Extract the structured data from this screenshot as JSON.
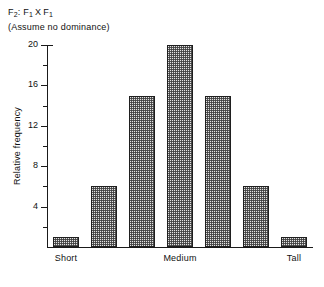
{
  "chart_data": {
    "type": "bar",
    "subtitle": "(Assume no dominance)",
    "title_parts": {
      "f_major": "F",
      "f_major_sub": "2",
      "colon": ":",
      "parent_a": "F",
      "parent_a_sub": "1",
      "cross": "X",
      "parent_b": "F",
      "parent_b_sub": "1"
    },
    "categories": [
      "Short",
      "",
      "",
      "Medium",
      "",
      "",
      "Tall"
    ],
    "category_labels": [
      "Short",
      "Medium",
      "Tall"
    ],
    "values": [
      1,
      6,
      15,
      20,
      15,
      6,
      1
    ],
    "xlabel": "",
    "ylabel": "Relative frequency",
    "ylim": [
      0,
      20
    ],
    "ytick_labels": [
      "4",
      "8",
      "12",
      "16",
      "20"
    ],
    "ytick_values": [
      4,
      8,
      12,
      16,
      20
    ],
    "yminor_values": [
      2,
      6,
      10,
      14,
      18
    ],
    "grid": false,
    "legend": false,
    "bar_fill": "#e3e3e3",
    "bar_edge": "#1f1f1f",
    "axis_color": "#1a1a1a"
  }
}
